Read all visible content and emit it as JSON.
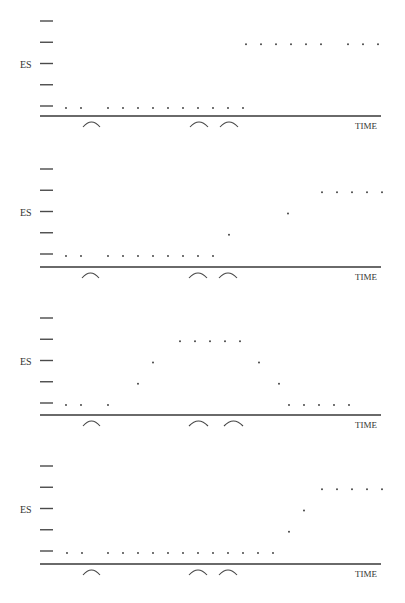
{
  "figure": {
    "panel_count": 4,
    "colors": {
      "axis": "#6a6a6a",
      "tick": "#4a4a4a",
      "dot": "#333333",
      "arc": "#444444",
      "label": "#333333"
    }
  },
  "chart_data": [
    {
      "type": "scatter",
      "title": "",
      "ylabel": "ES",
      "xlabel": "TIME",
      "y_levels": 5,
      "ylim": [
        0,
        4
      ],
      "grid": false,
      "points": [
        {
          "x": 66,
          "level": 0
        },
        {
          "x": 81,
          "level": 0
        },
        {
          "x": 108,
          "level": 0
        },
        {
          "x": 123,
          "level": 0
        },
        {
          "x": 138,
          "level": 0
        },
        {
          "x": 153,
          "level": 0
        },
        {
          "x": 168,
          "level": 0
        },
        {
          "x": 183,
          "level": 0
        },
        {
          "x": 198,
          "level": 0
        },
        {
          "x": 213,
          "level": 0
        },
        {
          "x": 228,
          "level": 0
        },
        {
          "x": 243,
          "level": 0
        },
        {
          "x": 246,
          "level": 3
        },
        {
          "x": 261,
          "level": 3
        },
        {
          "x": 276,
          "level": 3
        },
        {
          "x": 291,
          "level": 3
        },
        {
          "x": 306,
          "level": 3
        },
        {
          "x": 321,
          "level": 3
        },
        {
          "x": 348,
          "level": 3
        },
        {
          "x": 363,
          "level": 3
        },
        {
          "x": 378,
          "level": 3
        }
      ],
      "arcs": [
        {
          "x1": 83,
          "x2": 100
        },
        {
          "x1": 190,
          "x2": 208
        },
        {
          "x1": 220,
          "x2": 238
        }
      ]
    },
    {
      "type": "scatter",
      "title": "",
      "ylabel": "ES",
      "xlabel": "TIME",
      "y_levels": 5,
      "ylim": [
        0,
        4
      ],
      "grid": false,
      "points": [
        {
          "x": 66,
          "level": 0
        },
        {
          "x": 81,
          "level": 0
        },
        {
          "x": 108,
          "level": 0
        },
        {
          "x": 123,
          "level": 0
        },
        {
          "x": 138,
          "level": 0
        },
        {
          "x": 153,
          "level": 0
        },
        {
          "x": 168,
          "level": 0
        },
        {
          "x": 183,
          "level": 0
        },
        {
          "x": 198,
          "level": 0
        },
        {
          "x": 213,
          "level": 0
        },
        {
          "x": 229,
          "level": 1
        },
        {
          "x": 288,
          "level": 2
        },
        {
          "x": 322,
          "level": 3
        },
        {
          "x": 337,
          "level": 3
        },
        {
          "x": 352,
          "level": 3
        },
        {
          "x": 367,
          "level": 3
        },
        {
          "x": 382,
          "level": 3
        }
      ],
      "arcs": [
        {
          "x1": 82,
          "x2": 99
        },
        {
          "x1": 189,
          "x2": 207
        },
        {
          "x1": 219,
          "x2": 237
        }
      ]
    },
    {
      "type": "scatter",
      "title": "",
      "ylabel": "ES",
      "xlabel": "TIME",
      "y_levels": 5,
      "ylim": [
        0,
        4
      ],
      "grid": false,
      "points": [
        {
          "x": 66,
          "level": 0
        },
        {
          "x": 81,
          "level": 0
        },
        {
          "x": 108,
          "level": 0
        },
        {
          "x": 138,
          "level": 1
        },
        {
          "x": 153,
          "level": 2
        },
        {
          "x": 180,
          "level": 3
        },
        {
          "x": 195,
          "level": 3
        },
        {
          "x": 210,
          "level": 3
        },
        {
          "x": 225,
          "level": 3
        },
        {
          "x": 240,
          "level": 3
        },
        {
          "x": 259,
          "level": 2
        },
        {
          "x": 279,
          "level": 1
        },
        {
          "x": 289,
          "level": 0
        },
        {
          "x": 304,
          "level": 0
        },
        {
          "x": 319,
          "level": 0
        },
        {
          "x": 334,
          "level": 0
        },
        {
          "x": 349,
          "level": 0
        }
      ],
      "arcs": [
        {
          "x1": 83,
          "x2": 100
        },
        {
          "x1": 189,
          "x2": 208
        },
        {
          "x1": 224,
          "x2": 243
        }
      ]
    },
    {
      "type": "scatter",
      "title": "",
      "ylabel": "ES",
      "xlabel": "TIME",
      "y_levels": 5,
      "ylim": [
        0,
        4
      ],
      "grid": false,
      "points": [
        {
          "x": 67,
          "level": 0
        },
        {
          "x": 82,
          "level": 0
        },
        {
          "x": 108,
          "level": 0
        },
        {
          "x": 123,
          "level": 0
        },
        {
          "x": 138,
          "level": 0
        },
        {
          "x": 153,
          "level": 0
        },
        {
          "x": 168,
          "level": 0
        },
        {
          "x": 183,
          "level": 0
        },
        {
          "x": 198,
          "level": 0
        },
        {
          "x": 213,
          "level": 0
        },
        {
          "x": 228,
          "level": 0
        },
        {
          "x": 243,
          "level": 0
        },
        {
          "x": 258,
          "level": 0
        },
        {
          "x": 273,
          "level": 0
        },
        {
          "x": 289,
          "level": 1
        },
        {
          "x": 304,
          "level": 2
        },
        {
          "x": 322,
          "level": 3
        },
        {
          "x": 337,
          "level": 3
        },
        {
          "x": 352,
          "level": 3
        },
        {
          "x": 367,
          "level": 3
        },
        {
          "x": 382,
          "level": 3
        }
      ],
      "arcs": [
        {
          "x1": 83,
          "x2": 100
        },
        {
          "x1": 189,
          "x2": 207
        },
        {
          "x1": 219,
          "x2": 237
        }
      ]
    }
  ],
  "layout": {
    "panels": [
      {
        "tick_top": 21,
        "tick_step": 21.25,
        "axis_y": 116
      },
      {
        "tick_top": 169,
        "tick_step": 21.25,
        "axis_y": 267
      },
      {
        "tick_top": 318,
        "tick_step": 21.25,
        "axis_y": 415
      },
      {
        "tick_top": 466,
        "tick_step": 21.25,
        "axis_y": 564
      }
    ]
  }
}
